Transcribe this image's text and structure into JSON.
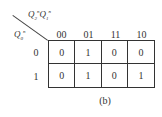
{
  "kmap": {
    "column_variable": {
      "base1": "Q",
      "sub1": "2",
      "sup1": "n",
      "base2": "Q",
      "sub2": "1",
      "sup2": "n"
    },
    "row_variable": {
      "base": "Q",
      "sub": "0",
      "sup": "n"
    },
    "column_headers": [
      "00",
      "01",
      "11",
      "10"
    ],
    "row_headers": [
      "0",
      "1"
    ],
    "rows": [
      [
        "0",
        "1",
        "0",
        "0"
      ],
      [
        "0",
        "1",
        "0",
        "1"
      ]
    ]
  },
  "caption": "(b)"
}
